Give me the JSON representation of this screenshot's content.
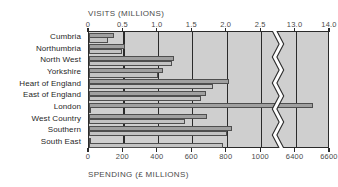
{
  "chart_data": {
    "type": "bar",
    "orientation": "horizontal",
    "title": "",
    "categories": [
      "Cumbria",
      "Northumbria",
      "North West",
      "Yorkshire",
      "Heart of England",
      "East of England",
      "London",
      "West Country",
      "Southern",
      "South East"
    ],
    "series": [
      {
        "name": "VISITS (MILLIONS)",
        "axis": "top",
        "unit": "millions",
        "color": "#a0a0a0",
        "values": [
          0.37,
          0.52,
          1.23,
          1.07,
          2.03,
          1.7,
          13.5,
          1.72,
          2.08,
          2.52
        ]
      },
      {
        "name": "SPENDING (£ MILLIONS)",
        "axis": "bottom",
        "unit": "£ millions",
        "color": "#c3c3c3",
        "values": [
          110,
          190,
          480,
          400,
          720,
          650,
          1010,
          560,
          800,
          780
        ]
      }
    ],
    "top_axis": {
      "label": "VISITS (MILLIONS)",
      "ticks": [
        "0",
        "0.5",
        "1.0",
        "1.5",
        "2.0",
        "2.5",
        "13.0",
        "14.0"
      ],
      "tick_values": [
        0,
        0.5,
        1.0,
        1.5,
        2.0,
        2.5,
        13.0,
        14.0
      ],
      "break_after": 2.5,
      "break_resume": 13.0
    },
    "bottom_axis": {
      "label": "SPENDING (£ MILLIONS)",
      "ticks": [
        "0",
        "200",
        "400",
        "600",
        "800",
        "1000",
        "6400",
        "6600"
      ],
      "tick_values": [
        0,
        200,
        400,
        600,
        800,
        1000,
        6400,
        6600
      ],
      "break_after": 1000,
      "break_resume": 6400
    },
    "annotations": [
      {
        "text": "2.52",
        "series": "VISITS (MILLIONS)",
        "category": "South East"
      }
    ],
    "grid": true,
    "legend": "none",
    "axis_break": true
  }
}
